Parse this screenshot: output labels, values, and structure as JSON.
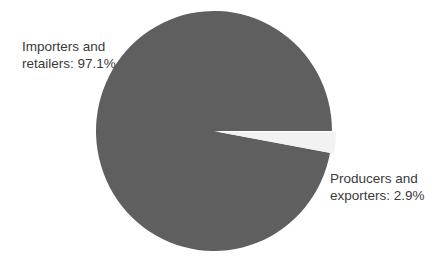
{
  "chart_data": {
    "type": "pie",
    "title": "",
    "slices": [
      {
        "label": "Importers and retailers",
        "value": 97.1,
        "color": "#5f5f5f"
      },
      {
        "label": "Producers and exporters",
        "value": 2.9,
        "color": "#f2f2f2"
      }
    ],
    "legend": "none",
    "data_labels": true
  },
  "labels": {
    "importers_line1": "Importers and",
    "importers_line2": "retailers:  97.1%",
    "producers_line1": "Producers and",
    "producers_line2": "exporters:  2.9%"
  }
}
